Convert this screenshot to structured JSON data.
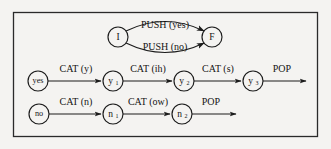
{
  "figure": {
    "kind": "recursive-transition-network",
    "background_color": "#f4f3f1",
    "ink_color": "#141414",
    "frame": {
      "stroke_color": "#2a2a2a"
    }
  },
  "push_level": {
    "start_node": {
      "id": "I",
      "label": "I",
      "cx": 118,
      "cy": 37,
      "r": 10
    },
    "end_node": {
      "id": "F",
      "label": "F",
      "cx": 212,
      "cy": 37,
      "r": 10
    },
    "arcs": [
      {
        "id": "push-yes",
        "label": "PUSH (yes)",
        "label_x": 165,
        "label_y": 26,
        "side": "upper"
      },
      {
        "id": "push-no",
        "label": "PUSH (no)",
        "label_x": 165,
        "label_y": 48,
        "side": "lower"
      }
    ]
  },
  "yes_level": {
    "nodes": [
      {
        "id": "yes",
        "label": "yes",
        "cx": 38,
        "cy": 81,
        "r": 10,
        "style": "word"
      },
      {
        "id": "y1",
        "label": "y",
        "sub": "1",
        "cx": 113,
        "cy": 81,
        "r": 10,
        "style": "sub"
      },
      {
        "id": "y2",
        "label": "y",
        "sub": "2",
        "cx": 184,
        "cy": 81,
        "r": 10,
        "style": "sub"
      },
      {
        "id": "y3",
        "label": "y",
        "sub": "3",
        "cx": 253,
        "cy": 81,
        "r": 10,
        "style": "sub"
      }
    ],
    "edges": [
      {
        "id": "yes-to-y1",
        "label": "CAT (y)",
        "label_x": 76,
        "label_y": 70,
        "x1": 48,
        "x2": 103,
        "y": 81
      },
      {
        "id": "y1-to-y2",
        "label": "CAT (ih)",
        "label_x": 148,
        "label_y": 70,
        "x1": 123,
        "x2": 174,
        "y": 81
      },
      {
        "id": "y2-to-y3",
        "label": "CAT (s)",
        "label_x": 218,
        "label_y": 70,
        "x1": 194,
        "x2": 243,
        "y": 81
      },
      {
        "id": "y3-pop",
        "label": "POP",
        "label_x": 282,
        "label_y": 70,
        "x1": 263,
        "x2": 307,
        "y": 81
      }
    ]
  },
  "no_level": {
    "nodes": [
      {
        "id": "no",
        "label": "no",
        "cx": 39,
        "cy": 114,
        "r": 10,
        "style": "word"
      },
      {
        "id": "n1",
        "label": "n",
        "sub": "1",
        "cx": 113,
        "cy": 114,
        "r": 10,
        "style": "sub"
      },
      {
        "id": "n2",
        "label": "n",
        "sub": "2",
        "cx": 182,
        "cy": 114,
        "r": 10,
        "style": "sub"
      }
    ],
    "edges": [
      {
        "id": "no-to-n1",
        "label": "CAT (n)",
        "label_x": 76,
        "label_y": 103,
        "x1": 49,
        "x2": 103,
        "y": 114
      },
      {
        "id": "n1-to-n2",
        "label": "CAT (ow)",
        "label_x": 148,
        "label_y": 103,
        "x1": 123,
        "x2": 172,
        "y": 114
      },
      {
        "id": "n2-pop",
        "label": "POP",
        "label_x": 211,
        "label_y": 103,
        "x1": 192,
        "x2": 237,
        "y": 114
      }
    ]
  }
}
